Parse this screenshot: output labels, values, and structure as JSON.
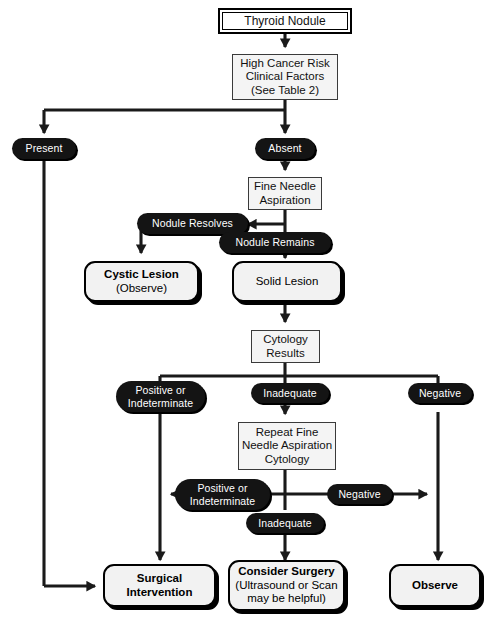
{
  "diagram": {
    "accent": "#141414",
    "line_color": "#1a1a1a",
    "box_fill": "#f2f2f2",
    "nodes": {
      "start": {
        "label": "Thyroid Nodule"
      },
      "risk": {
        "line1": "High Cancer Risk",
        "line2": "Clinical Factors",
        "line3": "(See Table 2)"
      },
      "fna": {
        "line1": "Fine Needle",
        "line2": "Aspiration"
      },
      "cystic": {
        "line1": "Cystic Lesion",
        "line2": "(Observe)"
      },
      "solid": {
        "line1": "Solid Lesion"
      },
      "cytology": {
        "line1": "Cytology",
        "line2": "Results"
      },
      "repeat": {
        "line1": "Repeat Fine",
        "line2": "Needle Aspiration",
        "line3": "Cytology"
      },
      "surgical": {
        "line1": "Surgical",
        "line2": "Intervention"
      },
      "consider": {
        "line1": "Consider Surgery",
        "line2": "(Ultrasound or Scan",
        "line3": "may be helpful)"
      },
      "observe": {
        "line1": "Observe"
      }
    },
    "edge_labels": {
      "present": "Present",
      "absent": "Absent",
      "nodule_resolves": "Nodule Resolves",
      "nodule_remains": "Nodule Remains",
      "pos_indet_1_a": "Positive or",
      "pos_indet_1_b": "Indeterminate",
      "inadequate_1": "Inadequate",
      "negative_1": "Negative",
      "pos_indet_2_a": "Positive or",
      "pos_indet_2_b": "Indeterminate",
      "negative_2": "Negative",
      "inadequate_2": "Inadequate"
    }
  }
}
